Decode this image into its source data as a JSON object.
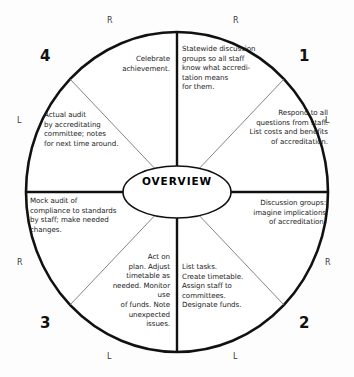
{
  "diagram": {
    "title": "OVERVIEW",
    "center_label": "OVERVIEW",
    "shape": "circle-wheel",
    "quadrant_numbers": [
      "1",
      "2",
      "3",
      "4"
    ],
    "edge_markers": {
      "top_left": "R",
      "top_right": "R",
      "left_upper": "L",
      "right_upper": "L",
      "left_lower": "R",
      "right_lower": "R",
      "bottom_left": "L",
      "bottom_right": "L"
    },
    "segments": [
      {
        "id": "seg-1-upper",
        "quadrant": "1",
        "position": "upper-right-inner",
        "text": "Statewide discussion\ngroups so all staff\nknow what accredi-\ntation means\nfor them."
      },
      {
        "id": "seg-1-lower",
        "quadrant": "1",
        "position": "upper-right-outer",
        "text": "Respond to all\nquestions from staff.\nList costs and benefits\nof accreditation."
      },
      {
        "id": "seg-2-upper",
        "quadrant": "2",
        "position": "lower-right-outer",
        "text": "Discussion groups:\nimagine implications\nof accreditation."
      },
      {
        "id": "seg-2-lower",
        "quadrant": "2",
        "position": "lower-right-inner",
        "text": "List tasks.\nCreate timetable.\nAssign staff to\ncommittees.\nDesignate funds."
      },
      {
        "id": "seg-3-right",
        "quadrant": "3",
        "position": "lower-left-inner",
        "text": "Act on\nplan. Adjust\ntimetable as\nneeded. Monitor use\nof funds. Note\nunexpected\nissues."
      },
      {
        "id": "seg-3-left",
        "quadrant": "3",
        "position": "lower-left-outer",
        "text": "Mock audit of\ncompliance to standards\nby staff; make needed\nchanges."
      },
      {
        "id": "seg-4-lower",
        "quadrant": "4",
        "position": "upper-left-outer",
        "text": "Actual audit\nby accreditating\ncommittee; notes\nfor next time around."
      },
      {
        "id": "seg-4-upper",
        "quadrant": "4",
        "position": "upper-left-inner",
        "text": "Celebrate\nachievement."
      }
    ],
    "colors": {
      "stroke": "#111111",
      "thin_stroke": "#555555",
      "text": "#1b1b1b",
      "background": "#fdfdfd"
    }
  }
}
